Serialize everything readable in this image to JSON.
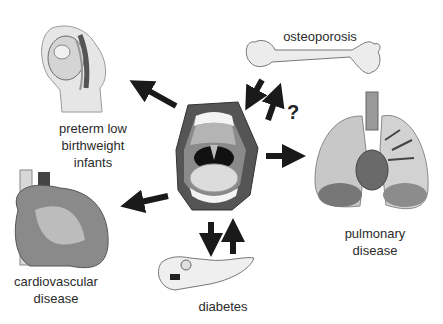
{
  "diagram": {
    "center": {
      "name": "oral cavity / periodontal disease",
      "icon": "open-mouth-icon"
    },
    "nodes": [
      {
        "id": "preterm",
        "label_lines": [
          "preterm low",
          "birthweight",
          "infants"
        ],
        "icon": "pregnancy-icon",
        "relation": "outgoing"
      },
      {
        "id": "osteoporosis",
        "label_lines": [
          "osteoporosis"
        ],
        "icon": "bone-icon",
        "relation": "bidirectional",
        "annotation": "?"
      },
      {
        "id": "pulmonary",
        "label_lines": [
          "pulmonary",
          "disease"
        ],
        "icon": "lungs-icon",
        "relation": "outgoing"
      },
      {
        "id": "cardiovascular",
        "label_lines": [
          "cardiovascular",
          "disease"
        ],
        "icon": "heart-icon",
        "relation": "outgoing"
      },
      {
        "id": "diabetes",
        "label_lines": [
          "diabetes"
        ],
        "icon": "pancreas-icon",
        "relation": "bidirectional"
      }
    ],
    "question_mark": "?"
  }
}
